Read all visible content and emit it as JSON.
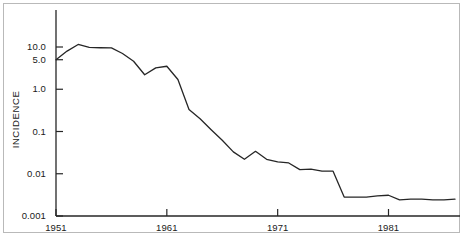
{
  "chart_data": {
    "type": "line",
    "title": "",
    "xlabel": "",
    "ylabel": "INCIDENCE",
    "yscale": "log",
    "ylim": [
      0.001,
      20
    ],
    "xlim": [
      1951,
      1987
    ],
    "grid": false,
    "legend": null,
    "ytick_labels": [
      "10.0",
      "5.0",
      "1.0",
      "0.1",
      "0.01",
      "0.001"
    ],
    "ytick_values": [
      10.0,
      5.0,
      1.0,
      0.1,
      0.01,
      0.001
    ],
    "xtick_labels": [
      "1951",
      "1961",
      "1971",
      "1981"
    ],
    "xtick_values": [
      1951,
      1961,
      1971,
      1981
    ],
    "x": [
      1951,
      1952,
      1953,
      1954,
      1955,
      1956,
      1957,
      1958,
      1959,
      1960,
      1961,
      1962,
      1963,
      1964,
      1965,
      1966,
      1967,
      1968,
      1969,
      1970,
      1971,
      1972,
      1973,
      1974,
      1975,
      1976,
      1977,
      1978,
      1979,
      1980,
      1981,
      1982,
      1983,
      1984,
      1985,
      1986,
      1987
    ],
    "values": [
      5.0,
      8.0,
      11.5,
      9.8,
      9.6,
      9.5,
      7.0,
      4.6,
      2.2,
      3.2,
      3.5,
      1.7,
      0.33,
      0.2,
      0.11,
      0.062,
      0.033,
      0.022,
      0.034,
      0.022,
      0.019,
      0.018,
      0.0125,
      0.0128,
      0.0115,
      0.0115,
      0.0028,
      0.0028,
      0.0028,
      0.003,
      0.0031,
      0.0024,
      0.0025,
      0.0025,
      0.0024,
      0.0024,
      0.0025
    ],
    "series": [
      {
        "name": "incidence",
        "color": "#262626",
        "values": [
          5.0,
          8.0,
          11.5,
          9.8,
          9.6,
          9.5,
          7.0,
          4.6,
          2.2,
          3.2,
          3.5,
          1.7,
          0.33,
          0.2,
          0.11,
          0.062,
          0.033,
          0.022,
          0.034,
          0.022,
          0.019,
          0.018,
          0.0125,
          0.0128,
          0.0115,
          0.0115,
          0.0028,
          0.0028,
          0.0028,
          0.003,
          0.0031,
          0.0024,
          0.0025,
          0.0025,
          0.0024,
          0.0024,
          0.0025
        ]
      }
    ],
    "axis_color": "#262626",
    "line_color": "#262626",
    "frame_color": "#b9b9b9",
    "background": "#ffffff"
  },
  "axis": {
    "ylabel": "INCIDENCE"
  }
}
